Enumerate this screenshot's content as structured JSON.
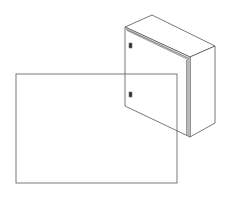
{
  "image": {
    "subject": "wall-mounted electrical enclosure cabinet (isometric line drawing)",
    "width": 232,
    "height": 198,
    "background": "#ffffff"
  },
  "colors": {
    "line": "#555555",
    "edge_shade": "#888888",
    "latch": "#333333",
    "overlay_rect": "#6a6a6a"
  },
  "enclosure": {
    "front_face": [
      [
        125,
        27
      ],
      [
        190,
        57
      ],
      [
        190,
        137
      ],
      [
        125,
        106
      ]
    ],
    "top_face": [
      [
        125,
        27
      ],
      [
        152,
        15
      ],
      [
        215,
        46
      ],
      [
        190,
        57
      ]
    ],
    "side_face": [
      [
        190,
        57
      ],
      [
        215,
        46
      ],
      [
        215,
        123
      ],
      [
        190,
        137
      ]
    ],
    "latches": [
      {
        "name": "upper-latch",
        "x": 129,
        "y": 43,
        "w": 3,
        "h": 5
      },
      {
        "name": "lower-latch",
        "x": 129,
        "y": 92,
        "w": 3,
        "h": 5
      }
    ]
  },
  "overlay_rectangle": {
    "x": 16,
    "y": 74,
    "width": 161,
    "height": 109
  }
}
